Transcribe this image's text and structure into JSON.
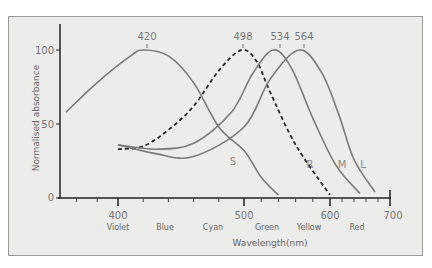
{
  "chart_data": {
    "type": "line",
    "title": "",
    "xlabel": "Wavelength(nm)",
    "ylabel": "Normalised absorbance",
    "x_ticks": [
      400,
      500,
      600,
      700
    ],
    "y_ticks": [
      0,
      50,
      100
    ],
    "ylim": [
      0,
      120
    ],
    "xlim": [
      350,
      700
    ],
    "grid": false,
    "color_bands": [
      "Violet",
      "Blue",
      "Cyan",
      "Green",
      "Yellow",
      "Red"
    ],
    "peaks": [
      {
        "label": "420",
        "wavelength": 420
      },
      {
        "label": "498",
        "wavelength": 498
      },
      {
        "label": "534",
        "wavelength": 534
      },
      {
        "label": "564",
        "wavelength": 564
      }
    ],
    "series": [
      {
        "name": "S",
        "peak": 420,
        "style": "solid",
        "points": [
          [
            350,
            58
          ],
          [
            380,
            78
          ],
          [
            410,
            96
          ],
          [
            420,
            100
          ],
          [
            440,
            96
          ],
          [
            460,
            78
          ],
          [
            480,
            48
          ],
          [
            500,
            32
          ],
          [
            520,
            14
          ],
          [
            540,
            2
          ]
        ]
      },
      {
        "name": "R",
        "peak": 498,
        "style": "dashed",
        "points": [
          [
            400,
            33
          ],
          [
            420,
            35
          ],
          [
            440,
            46
          ],
          [
            460,
            62
          ],
          [
            480,
            86
          ],
          [
            498,
            100
          ],
          [
            515,
            92
          ],
          [
            530,
            72
          ],
          [
            560,
            36
          ],
          [
            600,
            2
          ]
        ]
      },
      {
        "name": "M",
        "peak": 534,
        "style": "solid",
        "points": [
          [
            400,
            36
          ],
          [
            430,
            33
          ],
          [
            460,
            37
          ],
          [
            490,
            58
          ],
          [
            510,
            84
          ],
          [
            534,
            100
          ],
          [
            555,
            88
          ],
          [
            580,
            54
          ],
          [
            610,
            22
          ],
          [
            650,
            3
          ]
        ]
      },
      {
        "name": "L",
        "peak": 564,
        "style": "solid",
        "points": [
          [
            400,
            36
          ],
          [
            430,
            30
          ],
          [
            460,
            28
          ],
          [
            500,
            48
          ],
          [
            530,
            80
          ],
          [
            564,
            100
          ],
          [
            590,
            85
          ],
          [
            615,
            56
          ],
          [
            640,
            26
          ],
          [
            675,
            4
          ]
        ]
      }
    ]
  },
  "labels": {
    "y_100": "100",
    "y_50": "50",
    "y_0": "0",
    "x_400": "400",
    "x_500": "500",
    "x_600": "600",
    "x_700": "700",
    "violet": "Violet",
    "blue": "Blue",
    "cyan": "Cyan",
    "green": "Green",
    "yellow": "Yellow",
    "red": "Red",
    "xlabel": "Wavelength(nm)",
    "ylabel": "Normalised absorbance",
    "peak_420": "420",
    "peak_498": "498",
    "peak_534": "534",
    "peak_564": "564",
    "curve_s": "S",
    "curve_r": "R",
    "curve_m": "M",
    "curve_l": "L"
  },
  "colors": {
    "background": "#ececea",
    "curve": "#7a7a7a",
    "axis": "#222222"
  }
}
